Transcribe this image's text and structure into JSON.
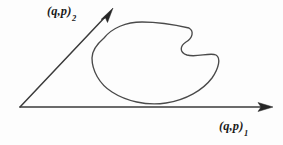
{
  "figure": {
    "kind": "phase-space-diagram",
    "background_color": "#fdfdfd",
    "line_color": "#3b3b3b",
    "curve_color": "#4a4a4a",
    "arrow_color": "#262626"
  },
  "axes": {
    "vertical": {
      "name": "axis-2",
      "label_base": "(q,p)",
      "label_subscript": "2",
      "origin": [
        20,
        107
      ],
      "tip": [
        113,
        8
      ],
      "arrow": true
    },
    "horizontal": {
      "name": "axis-1",
      "label_base": "(q,p)",
      "label_subscript": "1",
      "origin": [
        20,
        107
      ],
      "tip": [
        273,
        107
      ],
      "arrow": true
    }
  },
  "curve": {
    "name": "closed-orbit",
    "closed": true,
    "description": "closed kidney-shaped invariant curve with concave notch on the right side",
    "bounds": {
      "x_min": 92,
      "x_max": 219,
      "y_min": 22,
      "y_max": 104
    },
    "path": "M 104 38 C 112 28 126 22 142 22 C 158 22 176 25 189 28 C 194 31 193 38 186 42 C 180 46 179 52 187 55 C 196 58 210 52 216 55 C 221 58 219 68 212 78 C 203 90 186 100 166 103 C 146 106 126 101 112 92 C 99 84 92 70 92 58 C 92 50 97 44 104 38 Z"
  }
}
